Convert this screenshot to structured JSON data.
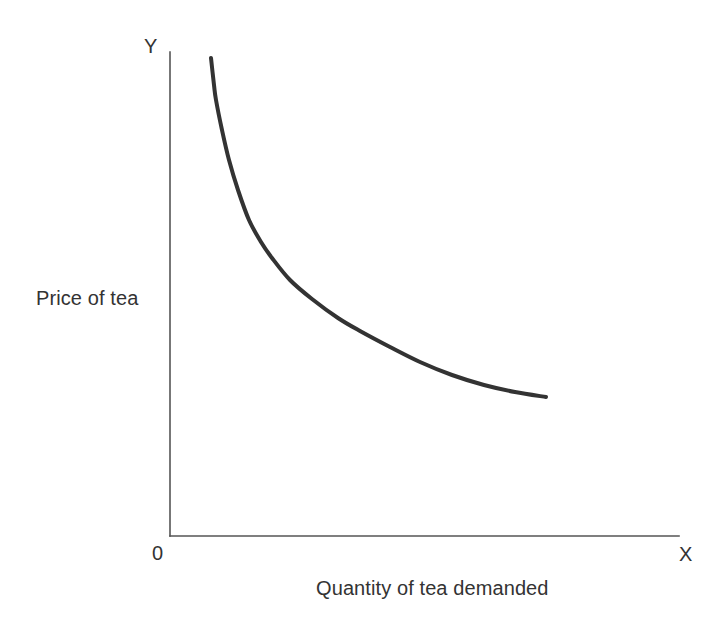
{
  "chart_data": {
    "type": "line",
    "title": "",
    "subtitle": "",
    "xlabel": "Quantity of tea demanded",
    "ylabel": "Price of tea",
    "x_axis_marker": "X",
    "y_axis_marker": "Y",
    "origin_label": "0",
    "grid": false,
    "legend": null,
    "xlim": [
      0,
      100
    ],
    "ylim": [
      0,
      100
    ],
    "axis_ticks": false,
    "tick_labels": {
      "x": [],
      "y": []
    },
    "annotations": [],
    "series": [
      {
        "name": "Demand curve for tea",
        "style": "solid",
        "color": "#333333",
        "line_width": 4,
        "shape": "convex-to-origin hyperbola (downward sloping demand curve)",
        "points_px": [
          [
            211,
            58
          ],
          [
            214,
            85
          ],
          [
            216,
            100
          ],
          [
            222,
            130
          ],
          [
            229,
            160
          ],
          [
            238,
            190
          ],
          [
            249,
            220
          ],
          [
            261,
            242
          ],
          [
            272,
            258
          ],
          [
            290,
            280
          ],
          [
            312,
            299
          ],
          [
            338,
            318
          ],
          [
            360,
            331
          ],
          [
            390,
            347
          ],
          [
            420,
            362
          ],
          [
            452,
            375
          ],
          [
            484,
            385
          ],
          [
            515,
            392
          ],
          [
            546,
            397
          ]
        ],
        "points_data": [
          {
            "quantity": 8,
            "price": 99
          },
          {
            "quantity": 9,
            "price": 93
          },
          {
            "quantity": 10,
            "price": 90
          },
          {
            "quantity": 11,
            "price": 84
          },
          {
            "quantity": 12,
            "price": 78
          },
          {
            "quantity": 14,
            "price": 72
          },
          {
            "quantity": 16,
            "price": 65
          },
          {
            "quantity": 18,
            "price": 61
          },
          {
            "quantity": 20,
            "price": 57
          },
          {
            "quantity": 24,
            "price": 53
          },
          {
            "quantity": 28,
            "price": 49
          },
          {
            "quantity": 33,
            "price": 45
          },
          {
            "quantity": 37,
            "price": 42
          },
          {
            "quantity": 43,
            "price": 39
          },
          {
            "quantity": 49,
            "price": 36
          },
          {
            "quantity": 55,
            "price": 33
          },
          {
            "quantity": 62,
            "price": 31
          },
          {
            "quantity": 68,
            "price": 30
          },
          {
            "quantity": 74,
            "price": 29
          }
        ]
      }
    ],
    "colors": {
      "background": "#ffffff",
      "axis": "#555555",
      "curve": "#333333",
      "text": "#333333"
    },
    "geometry": {
      "axis_origin_px": [
        170,
        536
      ],
      "y_axis_top_px": 52,
      "x_axis_right_px": 679,
      "axis_line_width": 1.6
    }
  }
}
